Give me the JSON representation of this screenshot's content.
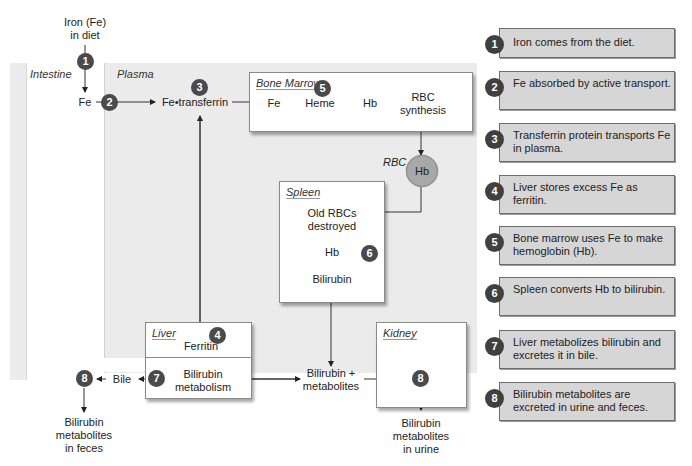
{
  "diagram": {
    "top_input": "Iron (Fe)\nin diet",
    "regions": {
      "intestine": "Intestine",
      "plasma": "Plasma"
    },
    "nodes": {
      "fe_intestine": "Fe",
      "fe_transferrin": "Fe•transferrin",
      "bile": "Bile",
      "bilirubin_metabolites": "Bilirubin +\nmetabolites",
      "feces_output": "Bilirubin\nmetabolites\nin feces",
      "urine_output": "Bilirubin\nmetabolites\nin urine",
      "rbc_label": "RBC",
      "rbc_hb": "Hb"
    },
    "boxes": {
      "bone_marrow": {
        "title": "Bone Marrow",
        "steps": [
          "Fe",
          "Heme",
          "Hb",
          "RBC\nsynthesis"
        ]
      },
      "spleen": {
        "title": "Spleen",
        "steps": [
          "Old RBCs\ndestroyed",
          "Hb",
          "Bilirubin"
        ]
      },
      "liver": {
        "title": "Liver",
        "top": "Ferritin",
        "bottom": "Bilirubin\nmetabolism"
      },
      "kidney": {
        "title": "Kidney"
      }
    },
    "badges": {
      "b1": "1",
      "b2": "2",
      "b3": "3",
      "b4": "4",
      "b5": "5",
      "b6": "6",
      "b7": "7",
      "b8_feces": "8",
      "b8_kidney": "8"
    },
    "colors": {
      "plasma_bg": "#ebebeb",
      "badge": "#4a4a4a",
      "rbc_fill": "#a8a8a8",
      "legend_bg": "#d6d6d6"
    }
  },
  "legend": [
    {
      "num": "1",
      "text": "Iron comes from the diet."
    },
    {
      "num": "2",
      "text": "Fe absorbed by active transport."
    },
    {
      "num": "3",
      "text": "Transferrin protein transports Fe in plasma."
    },
    {
      "num": "4",
      "text": "Liver stores excess Fe as ferritin."
    },
    {
      "num": "5",
      "text": "Bone marrow uses Fe to make hemoglobin (Hb)."
    },
    {
      "num": "6",
      "text": "Spleen converts Hb to bilirubin."
    },
    {
      "num": "7",
      "text": "Liver metabolizes bilirubin and excretes it in bile."
    },
    {
      "num": "8",
      "text": "Bilirubin metabolites are excreted in urine and feces."
    }
  ]
}
